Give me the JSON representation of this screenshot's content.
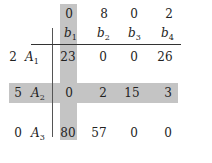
{
  "matrix": {
    "column_values": [
      "0",
      "8",
      "0",
      "2"
    ],
    "column_labels": [
      {
        "base": "b",
        "sub": "1"
      },
      {
        "base": "b",
        "sub": "2"
      },
      {
        "base": "b",
        "sub": "3"
      },
      {
        "base": "b",
        "sub": "4"
      }
    ],
    "rows": [
      {
        "value": "2",
        "label": {
          "base": "A",
          "sub": "1"
        },
        "cells": [
          "23",
          "0",
          "0",
          "26"
        ]
      },
      {
        "value": "5",
        "label": {
          "base": "A",
          "sub": "2"
        },
        "cells": [
          "0",
          "2",
          "15",
          "3"
        ]
      },
      {
        "value": "0",
        "label": {
          "base": "A",
          "sub": "3"
        },
        "cells": [
          "80",
          "57",
          "0",
          "0"
        ]
      }
    ],
    "highlight": {
      "column": "b1",
      "row": "A2",
      "color": "#c4c4c4"
    }
  }
}
